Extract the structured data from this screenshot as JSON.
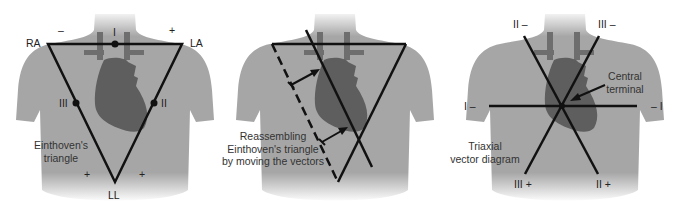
{
  "colors": {
    "background": "#ffffff",
    "torso": "#a6a6a6",
    "heart": "#5e5e5e",
    "vessels": "#6e6e6e",
    "lines": "#111111"
  },
  "panels": [
    {
      "id": "einthoven",
      "caption": [
        "Einthoven's",
        "triangle"
      ],
      "labels": {
        "ra": "RA",
        "la": "LA",
        "ll": "LL",
        "lead_i": "I",
        "lead_ii": "II",
        "lead_iii": "III",
        "minus_top": "–",
        "plus_top": "+",
        "plus_left": "+",
        "plus_right": "+"
      }
    },
    {
      "id": "reassembling",
      "caption": [
        "Reassembling",
        "Einthoven's triangle",
        "by moving the vectors"
      ]
    },
    {
      "id": "triaxial",
      "caption": [
        "Triaxial",
        "vector diagram"
      ],
      "annotation": [
        "Central",
        "terminal"
      ],
      "labels": {
        "ii_minus": "II –",
        "iii_minus": "III –",
        "i_minus_left": "I –",
        "minus_i_right": "– I",
        "iii_plus": "III +",
        "ii_plus": "II +"
      }
    }
  ]
}
